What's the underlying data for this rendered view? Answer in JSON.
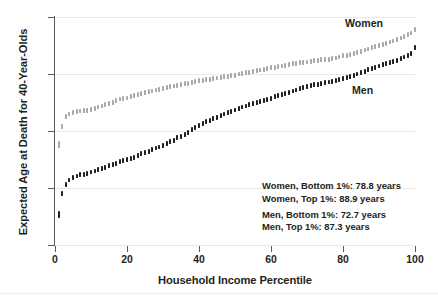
{
  "chart_data": {
    "type": "scatter",
    "title": "",
    "xlabel": "Household Income Percentile",
    "ylabel": "Expected Age at Death for 40-Year-Olds",
    "xlim": [
      0,
      100
    ],
    "ylim": [
      70,
      90
    ],
    "xticks": [
      0,
      20,
      40,
      60,
      80,
      100
    ],
    "yticks": [
      70,
      75,
      80,
      85,
      90
    ],
    "grid": "horizontal",
    "legend_position": "inline-series-labels",
    "marker_style": "thin vertical confidence-interval bars",
    "series": [
      {
        "name": "Women",
        "color": "#a7a9ac",
        "x": [
          1,
          2,
          3,
          4,
          5,
          6,
          7,
          8,
          9,
          10,
          11,
          12,
          13,
          14,
          15,
          16,
          17,
          18,
          19,
          20,
          21,
          22,
          23,
          24,
          25,
          26,
          27,
          28,
          29,
          30,
          31,
          32,
          33,
          34,
          35,
          36,
          37,
          38,
          39,
          40,
          41,
          42,
          43,
          44,
          45,
          46,
          47,
          48,
          49,
          50,
          51,
          52,
          53,
          54,
          55,
          56,
          57,
          58,
          59,
          60,
          61,
          62,
          63,
          64,
          65,
          66,
          67,
          68,
          69,
          70,
          71,
          72,
          73,
          74,
          75,
          76,
          77,
          78,
          79,
          80,
          81,
          82,
          83,
          84,
          85,
          86,
          87,
          88,
          89,
          90,
          91,
          92,
          93,
          94,
          95,
          96,
          97,
          98,
          99,
          100
        ],
        "values": [
          78.8,
          80.4,
          81.3,
          81.5,
          81.6,
          81.7,
          81.75,
          81.8,
          81.8,
          81.9,
          82.0,
          82.1,
          82.2,
          82.3,
          82.4,
          82.5,
          82.7,
          82.8,
          82.85,
          82.9,
          83.0,
          83.1,
          83.2,
          83.3,
          83.4,
          83.45,
          83.5,
          83.6,
          83.65,
          83.7,
          83.8,
          83.9,
          83.95,
          84.0,
          84.1,
          84.15,
          84.2,
          84.25,
          84.35,
          84.4,
          84.45,
          84.5,
          84.55,
          84.6,
          84.65,
          84.7,
          84.75,
          84.8,
          84.85,
          84.9,
          85.0,
          85.05,
          85.1,
          85.15,
          85.2,
          85.3,
          85.35,
          85.4,
          85.5,
          85.55,
          85.6,
          85.65,
          85.7,
          85.75,
          85.85,
          85.9,
          85.95,
          86.0,
          86.0,
          86.05,
          86.1,
          86.15,
          86.2,
          86.25,
          86.3,
          86.3,
          86.35,
          86.4,
          86.5,
          86.6,
          86.65,
          86.7,
          86.8,
          86.9,
          87.0,
          87.1,
          87.2,
          87.3,
          87.4,
          87.5,
          87.6,
          87.7,
          87.8,
          87.9,
          88.0,
          88.15,
          88.3,
          88.45,
          88.6,
          88.9
        ],
        "bottom_1_pct": 78.8,
        "top_1_pct": 88.9
      },
      {
        "name": "Men",
        "color": "#231f20",
        "x": [
          1,
          2,
          3,
          4,
          5,
          6,
          7,
          8,
          9,
          10,
          11,
          12,
          13,
          14,
          15,
          16,
          17,
          18,
          19,
          20,
          21,
          22,
          23,
          24,
          25,
          26,
          27,
          28,
          29,
          30,
          31,
          32,
          33,
          34,
          35,
          36,
          37,
          38,
          39,
          40,
          41,
          42,
          43,
          44,
          45,
          46,
          47,
          48,
          49,
          50,
          51,
          52,
          53,
          54,
          55,
          56,
          57,
          58,
          59,
          60,
          61,
          62,
          63,
          64,
          65,
          66,
          67,
          68,
          69,
          70,
          71,
          72,
          73,
          74,
          75,
          76,
          77,
          78,
          79,
          80,
          81,
          82,
          83,
          84,
          85,
          86,
          87,
          88,
          89,
          90,
          91,
          92,
          93,
          94,
          95,
          96,
          97,
          98,
          99,
          100
        ],
        "values": [
          72.7,
          74.5,
          75.3,
          75.7,
          75.9,
          76.05,
          76.15,
          76.2,
          76.3,
          76.4,
          76.5,
          76.6,
          76.7,
          76.8,
          76.95,
          77.05,
          77.15,
          77.3,
          77.4,
          77.5,
          77.6,
          77.7,
          77.85,
          78.0,
          78.1,
          78.2,
          78.35,
          78.5,
          78.6,
          78.75,
          78.9,
          79.05,
          79.2,
          79.4,
          79.55,
          79.7,
          79.9,
          80.1,
          80.3,
          80.5,
          80.65,
          80.8,
          80.95,
          81.1,
          81.2,
          81.35,
          81.5,
          81.6,
          81.7,
          81.85,
          82.0,
          82.1,
          82.2,
          82.3,
          82.4,
          82.5,
          82.6,
          82.65,
          82.75,
          82.85,
          83.0,
          83.1,
          83.2,
          83.3,
          83.4,
          83.5,
          83.6,
          83.7,
          83.8,
          83.9,
          84.0,
          84.05,
          84.1,
          84.2,
          84.25,
          84.3,
          84.35,
          84.4,
          84.5,
          84.6,
          84.7,
          84.8,
          84.9,
          85.0,
          85.1,
          85.25,
          85.4,
          85.5,
          85.6,
          85.7,
          85.8,
          85.9,
          86.0,
          86.1,
          86.2,
          86.35,
          86.5,
          86.65,
          86.8,
          87.3
        ],
        "bottom_1_pct": 72.7,
        "top_1_pct": 87.3
      }
    ],
    "annotations": [
      "Women, Bottom 1%: 78.8 years",
      "Women, Top 1%: 88.9 years",
      "Men, Bottom 1%: 72.7 years",
      "Men, Top 1%: 87.3 years"
    ]
  },
  "axes": {
    "x": {
      "label": "Household Income Percentile",
      "tick_labels": [
        "0",
        "20",
        "40",
        "60",
        "80",
        "100"
      ]
    },
    "y": {
      "label": "Expected Age at Death for 40-Year-Olds",
      "tick_labels": [
        "70",
        "75",
        "80",
        "85",
        "90"
      ]
    }
  },
  "series_labels": {
    "women": "Women",
    "men": "Men"
  },
  "colors": {
    "women": "#a7a9ac",
    "men": "#231f20",
    "axis": "#58595b",
    "grid": "#e8e8e9",
    "text": "#231f20",
    "background": "#ffffff"
  }
}
